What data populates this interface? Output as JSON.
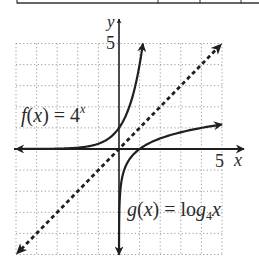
{
  "table_fragment": {
    "bottom_border_y": 3,
    "left_x": 17,
    "dividers_x": [
      158,
      200,
      241
    ]
  },
  "chart_data": {
    "type": "line",
    "title": "",
    "xlabel": "x",
    "ylabel": "y",
    "xlim": [
      -5,
      5
    ],
    "ylim": [
      -5,
      5
    ],
    "grid": true,
    "grid_step": 1,
    "tick_labels": {
      "x": [
        "5"
      ],
      "y": [
        "5"
      ]
    },
    "series": [
      {
        "name": "f(x) = 4^x",
        "expression": "4^x",
        "style": "solid",
        "x_range": [
          -5,
          1.16
        ],
        "arrows": [
          "left",
          "right"
        ],
        "points": [
          [
            -5,
            0.001
          ],
          [
            -2,
            0.0625
          ],
          [
            -1,
            0.25
          ],
          [
            0,
            1
          ],
          [
            0.5,
            2
          ],
          [
            1,
            4
          ],
          [
            1.16,
            5
          ]
        ]
      },
      {
        "name": "g(x) = log4 x",
        "expression": "log_4(x)",
        "style": "solid",
        "x_range": [
          0.001,
          5
        ],
        "arrows": [
          "down",
          "right"
        ],
        "points": [
          [
            0.001,
            -5
          ],
          [
            0.0625,
            -2
          ],
          [
            0.25,
            -1
          ],
          [
            1,
            0
          ],
          [
            2,
            0.5
          ],
          [
            4,
            1
          ],
          [
            5,
            1.16
          ]
        ]
      },
      {
        "name": "y = x",
        "expression": "x",
        "style": "dashed",
        "x_range": [
          -5,
          5
        ],
        "arrows": [
          "down-left",
          "up-right"
        ],
        "points": [
          [
            -5,
            -5
          ],
          [
            0,
            0
          ],
          [
            5,
            5
          ]
        ]
      }
    ],
    "annotations": [
      {
        "text_main": "f(x) = 4",
        "text_sup": "x",
        "position": "upper-left"
      },
      {
        "text_main": "g(x) = log",
        "text_sub": "4",
        "text_tail": "x",
        "position": "lower-right"
      }
    ]
  },
  "labels": {
    "y_axis": "y",
    "x_axis": "x",
    "y_tick": "5",
    "x_tick": "5",
    "f_main": "f(x) = 4",
    "f_sup": "x",
    "g_main": "g(x) = log",
    "g_sub": "4",
    "g_tail": "x"
  },
  "colors": {
    "curve": "#1f1f1f",
    "grid": "#9a9a9a",
    "text": "#2b2b2b"
  }
}
